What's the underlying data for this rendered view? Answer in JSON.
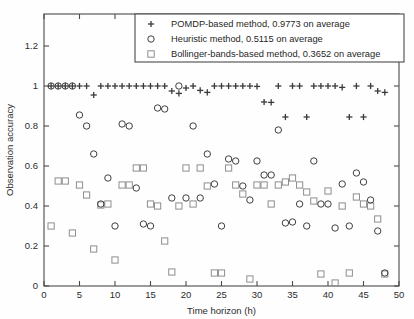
{
  "chart_data": {
    "type": "scatter",
    "title": "",
    "xlabel": "Time horizon (h)",
    "ylabel": "Observation accuracy",
    "xlim": [
      0,
      50
    ],
    "ylim": [
      0,
      1.3
    ],
    "xticks": [
      0,
      5,
      10,
      15,
      20,
      25,
      30,
      35,
      40,
      45,
      50
    ],
    "xticklabels": [
      "0",
      "5",
      "10",
      "15",
      "20",
      "25",
      "30",
      "35",
      "40",
      "45",
      "50"
    ],
    "yticks": [
      0,
      0.2,
      0.4,
      0.6,
      0.8,
      1,
      1.2
    ],
    "yticklabels": [
      "0",
      "0.2",
      "0.4",
      "0.6",
      "0.8",
      "1",
      "1.2"
    ],
    "grid": false,
    "legend_position": "top-right",
    "series": [
      {
        "name": "POMDP-based method, 0.9773 on average",
        "marker": "plus",
        "color": "#3a3a3a",
        "average": 0.9773,
        "x": [
          1,
          2,
          3,
          4,
          5,
          6,
          7,
          8,
          9,
          10,
          11,
          12,
          13,
          14,
          15,
          16,
          17,
          18,
          19,
          20,
          21,
          22,
          23,
          24,
          25,
          26,
          27,
          28,
          29,
          30,
          31,
          32,
          33,
          34,
          35,
          36,
          37,
          38,
          39,
          40,
          41,
          42,
          43,
          44,
          45,
          46,
          47,
          48
        ],
        "y": [
          1,
          1,
          1,
          1,
          1,
          1,
          0.955,
          1,
          1,
          1,
          1,
          1,
          1,
          1,
          1,
          1,
          1,
          0.975,
          0.963,
          0.99,
          1,
          0.978,
          0.968,
          1,
          1,
          1,
          1,
          1,
          1,
          0.998,
          0.92,
          0.918,
          1,
          0.845,
          1,
          1,
          0.845,
          1,
          1,
          1,
          1,
          0.993,
          0.845,
          1,
          0.845,
          1,
          0.975,
          0.968
        ]
      },
      {
        "name": "Heuristic method, 0.5115 on average",
        "marker": "circle",
        "color": "#3f3f3f",
        "average": 0.5115,
        "x": [
          1,
          2,
          3,
          4,
          5,
          6,
          7,
          8,
          9,
          10,
          11,
          12,
          13,
          14,
          15,
          16,
          17,
          18,
          19,
          20,
          21,
          22,
          23,
          24,
          25,
          26,
          27,
          28,
          29,
          30,
          31,
          32,
          33,
          34,
          35,
          36,
          37,
          38,
          39,
          40,
          41,
          42,
          43,
          44,
          45,
          46,
          47,
          48
        ],
        "y": [
          1,
          1,
          1,
          1,
          0.855,
          0.8,
          0.66,
          0.41,
          0.54,
          0.3,
          0.81,
          0.8,
          0.49,
          0.31,
          0.3,
          0.89,
          0.885,
          0.44,
          1,
          0.44,
          0.8,
          0.44,
          0.66,
          0.51,
          0.3,
          0.635,
          0.625,
          0.5,
          0.43,
          0.625,
          0.555,
          0.555,
          0.78,
          0.315,
          0.32,
          0.41,
          0.3,
          0.625,
          0.41,
          0.41,
          0.29,
          0.51,
          0.3,
          0.565,
          0.52,
          0.43,
          0.275,
          0.065
        ]
      },
      {
        "name": "Bollinger-bands-based method, 0.3652 on average",
        "marker": "square",
        "color": "#8e8e8e",
        "average": 0.3652,
        "x": [
          1,
          2,
          3,
          4,
          5,
          6,
          7,
          8,
          9,
          10,
          11,
          12,
          13,
          14,
          15,
          16,
          17,
          18,
          19,
          20,
          21,
          22,
          23,
          24,
          25,
          26,
          27,
          28,
          29,
          30,
          31,
          32,
          33,
          34,
          35,
          36,
          37,
          38,
          39,
          40,
          41,
          42,
          43,
          44,
          45,
          46,
          47,
          48
        ],
        "y": [
          0.3,
          0.525,
          0.525,
          0.265,
          0.505,
          0.455,
          0.185,
          0.405,
          0.41,
          0.13,
          0.505,
          0.505,
          0.59,
          0.59,
          0.41,
          0.4,
          0.225,
          0.07,
          0.4,
          0.59,
          0.41,
          0.59,
          0.5,
          0.065,
          0.065,
          0.59,
          0.505,
          0.46,
          0.035,
          0.505,
          0.505,
          0.41,
          0.505,
          0.52,
          0.54,
          0.505,
          0.47,
          0.425,
          0.06,
          0.475,
          0.015,
          0.4,
          0.065,
          0.445,
          0.41,
          0.4,
          0.335,
          0.06
        ]
      }
    ]
  },
  "legend": {
    "entries": [
      {
        "marker": "plus",
        "label": "POMDP-based method, 0.9773 on average"
      },
      {
        "marker": "circle",
        "label": "Heuristic method, 0.5115 on average"
      },
      {
        "marker": "square",
        "label": "Bollinger-bands-based method, 0.3652 on average"
      }
    ]
  }
}
